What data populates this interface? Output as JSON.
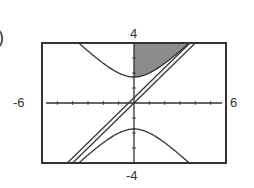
{
  "figure_label": ")",
  "axes": {
    "xmin_label": "-6",
    "xmax_label": "6",
    "ymin_label": "-4",
    "ymax_label": "4"
  },
  "colors": {
    "frame": "#333333",
    "curve": "#333333",
    "shade": "#8c8c8c"
  },
  "chart_data": {
    "type": "line",
    "title": "",
    "xlabel": "",
    "ylabel": "",
    "xlim": [
      -6,
      6
    ],
    "ylim": [
      -4,
      4
    ],
    "xticks_step": 1,
    "yticks_step": 1,
    "grid": false,
    "series": [
      {
        "name": "hyperbola upper branch",
        "equation": "y = sqrt(3 + x^2)",
        "vertex": [
          0,
          1.73
        ]
      },
      {
        "name": "hyperbola lower branch",
        "equation": "y = -sqrt(3 + x^2)",
        "vertex": [
          0,
          -1.73
        ]
      },
      {
        "name": "line 1",
        "equation": "y = x"
      },
      {
        "name": "line 2",
        "equation": "y = x + 0.35"
      }
    ],
    "shaded_region": "x >= 0, y >= sqrt(3 + x^2), y <= 4, left of line"
  }
}
